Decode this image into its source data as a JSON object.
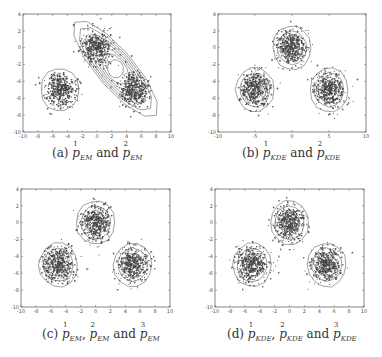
{
  "figure": {
    "panels": [
      {
        "id": "a",
        "caption": {
          "label": "(a)",
          "terms": [
            {
              "sup": "1",
              "sub": "EM"
            },
            {
              "sup": "2",
              "sub": "EM"
            }
          ],
          "joiners": [
            "and"
          ]
        },
        "box": {
          "left": 23,
          "top": 14,
          "right": 171,
          "bottom": 132
        },
        "caption_pos": {
          "x": 97,
          "y": 155
        }
      },
      {
        "id": "b",
        "caption": {
          "label": "(b)",
          "terms": [
            {
              "sup": "1",
              "sub": "KDE"
            },
            {
              "sup": "2",
              "sub": "KDE"
            }
          ],
          "joiners": [
            "and"
          ]
        },
        "box": {
          "left": 218,
          "top": 14,
          "right": 366,
          "bottom": 132
        },
        "caption_pos": {
          "x": 291,
          "y": 155
        }
      },
      {
        "id": "c",
        "caption": {
          "label": "(c)",
          "terms": [
            {
              "sup": "1",
              "sub": "EM"
            },
            {
              "sup": "2",
              "sub": "EM"
            },
            {
              "sup": "3",
              "sub": "EM"
            }
          ],
          "joiners": [
            ",",
            "and"
          ]
        },
        "box": {
          "left": 21,
          "top": 189,
          "right": 170,
          "bottom": 307
        },
        "caption_pos": {
          "x": 101,
          "y": 336
        }
      },
      {
        "id": "d",
        "caption": {
          "label": "(d)",
          "terms": [
            {
              "sup": "1",
              "sub": "KDE"
            },
            {
              "sup": "2",
              "sub": "KDE"
            },
            {
              "sup": "3",
              "sub": "KDE"
            }
          ],
          "joiners": [
            ",",
            "and"
          ]
        },
        "box": {
          "left": 215,
          "top": 189,
          "right": 364,
          "bottom": 307
        },
        "caption_pos": {
          "x": 292,
          "y": 336
        }
      }
    ],
    "captions_text": [
      "(a) p^1_EM and p^2_EM",
      "(b) p^1_KDE and p^2_KDE",
      "(c) p^1_EM, p^2_EM and p^3_EM",
      "(d) p^1_KDE, p^2_KDE and p^3_KDE"
    ]
  },
  "chart_data": [
    {
      "type": "scatter",
      "title": "(a) p^1_EM and p^2_EM",
      "xlabel": "",
      "ylabel": "",
      "xlim": [
        -10,
        10
      ],
      "ylim": [
        -10,
        4
      ],
      "xticks": [
        -10,
        -8,
        -6,
        -4,
        -2,
        0,
        2,
        4,
        6,
        8,
        10
      ],
      "yticks": [
        -10,
        -8,
        -6,
        -4,
        -2,
        0,
        2,
        4
      ],
      "grid": false,
      "clusters": [
        {
          "center": [
            -5,
            -5
          ],
          "std": 1.0
        },
        {
          "center": [
            0,
            0
          ],
          "std": 1.0
        },
        {
          "center": [
            5,
            -5
          ],
          "std": 1.0
        }
      ],
      "contours": [
        {
          "name": "p1_EM",
          "center": [
            -5,
            -5
          ],
          "shape": "circular",
          "radii": [
            2.6
          ]
        },
        {
          "name": "p2_EM",
          "center": [
            2.5,
            -2.5
          ],
          "shape": "elongated ellipse along y=-x",
          "semi_major": 7.8,
          "semi_minor": 2.4,
          "levels": 7
        }
      ]
    },
    {
      "type": "scatter",
      "title": "(b) p^1_KDE and p^2_KDE",
      "xlabel": "",
      "ylabel": "",
      "xlim": [
        -10,
        10
      ],
      "ylim": [
        -10,
        4
      ],
      "xticks": [
        -10,
        -5,
        0,
        5,
        10
      ],
      "yticks": [
        -10,
        -8,
        -6,
        -4,
        -2,
        0,
        2,
        4
      ],
      "grid": false,
      "clusters": [
        {
          "center": [
            -5,
            -5
          ],
          "std": 1.0
        },
        {
          "center": [
            0,
            0
          ],
          "std": 1.0
        },
        {
          "center": [
            5,
            -5
          ],
          "std": 1.0
        }
      ],
      "contours": [
        {
          "name": "p1_KDE",
          "center": [
            -5,
            -5
          ],
          "shape": "circular",
          "radii": [
            2.6,
            2.0,
            1.5,
            1.0
          ]
        },
        {
          "name": "p2_KDE",
          "centers": [
            [
              0,
              0
            ],
            [
              5,
              -5
            ]
          ],
          "shape": "circular",
          "radii": [
            2.6,
            2.0,
            1.5,
            1.0
          ]
        }
      ]
    },
    {
      "type": "scatter",
      "title": "(c) p^1_EM, p^2_EM and p^3_EM",
      "xlabel": "",
      "ylabel": "",
      "xlim": [
        -10,
        10
      ],
      "ylim": [
        -10,
        4
      ],
      "xticks": [
        -10,
        -8,
        -6,
        -4,
        -2,
        0,
        2,
        4,
        6,
        8,
        10
      ],
      "yticks": [
        -10,
        -8,
        -6,
        -4,
        -2,
        0,
        2,
        4
      ],
      "grid": false,
      "clusters": [
        {
          "center": [
            -5,
            -5
          ],
          "std": 1.0
        },
        {
          "center": [
            0,
            0
          ],
          "std": 1.0
        },
        {
          "center": [
            5,
            -5
          ],
          "std": 1.0
        }
      ],
      "contours": [
        {
          "name": "p1_EM",
          "center": [
            -5,
            -5
          ],
          "shape": "circular",
          "radii": [
            2.6,
            2.0,
            1.4,
            0.8
          ]
        },
        {
          "name": "p2_EM",
          "center": [
            0,
            0
          ],
          "shape": "circular",
          "radii": [
            2.6,
            2.0,
            1.4,
            0.8
          ]
        },
        {
          "name": "p3_EM",
          "center": [
            5,
            -5
          ],
          "shape": "circular",
          "radii": [
            2.6,
            2.0,
            1.4,
            0.8
          ]
        }
      ]
    },
    {
      "type": "scatter",
      "title": "(d) p^1_KDE, p^2_KDE and p^3_KDE",
      "xlabel": "",
      "ylabel": "",
      "xlim": [
        -10,
        10
      ],
      "ylim": [
        -10,
        4
      ],
      "xticks": [
        -10,
        -8,
        -6,
        -4,
        -2,
        0,
        2,
        4,
        6,
        8,
        10
      ],
      "yticks": [
        -10,
        -8,
        -6,
        -4,
        -2,
        0,
        2,
        4
      ],
      "grid": false,
      "clusters": [
        {
          "center": [
            -5,
            -5
          ],
          "std": 1.0
        },
        {
          "center": [
            0,
            0
          ],
          "std": 1.0
        },
        {
          "center": [
            5,
            -5
          ],
          "std": 1.0
        }
      ],
      "contours": [
        {
          "name": "p1_KDE",
          "center": [
            -5,
            -5
          ],
          "shape": "circular",
          "radii": [
            2.6,
            2.0,
            1.4,
            0.8
          ]
        },
        {
          "name": "p2_KDE",
          "center": [
            0,
            0
          ],
          "shape": "circular",
          "radii": [
            2.6,
            2.0,
            1.4,
            0.8
          ]
        },
        {
          "name": "p3_KDE",
          "center": [
            5,
            -5
          ],
          "shape": "circular",
          "radii": [
            2.6,
            2.0,
            1.4,
            0.8
          ]
        }
      ]
    }
  ]
}
